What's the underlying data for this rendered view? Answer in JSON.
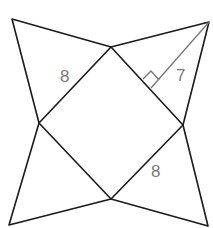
{
  "diagram": {
    "labels": {
      "base_side": "8",
      "slant_height": "7",
      "base_side_bottom": "8"
    },
    "colors": {
      "edges": "#1a1a1a",
      "height_line": "#7a7a7a",
      "label_text": "#7a7a7a"
    }
  }
}
